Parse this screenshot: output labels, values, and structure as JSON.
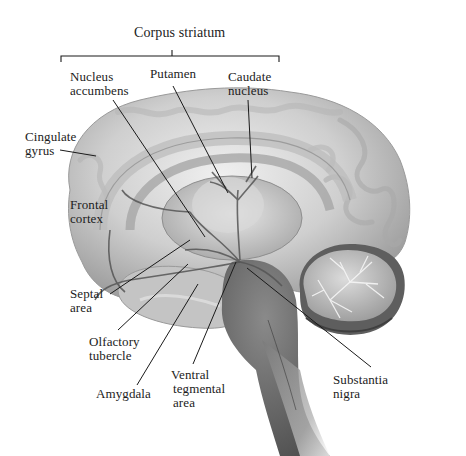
{
  "diagram": {
    "title": "Corpus striatum",
    "colors": {
      "background": "#ffffff",
      "cortex_light": "#e6e6e6",
      "cortex_mid": "#bdbdbd",
      "cortex_dark": "#8a8a8a",
      "brainstem": "#6e6e6e",
      "pathways": "#5a5a5a",
      "leader_lines": "#1a1a1a",
      "text": "#1c1c1c"
    },
    "bracket": {
      "label": "Corpus striatum",
      "groups": [
        "Nucleus accumbens",
        "Putamen",
        "Caudate nucleus"
      ]
    },
    "labels": {
      "corpus_striatum": "Corpus striatum",
      "nucleus_accumbens": {
        "line1": "Nucleus",
        "line2": "accumbens"
      },
      "putamen": "Putamen",
      "caudate_nucleus": {
        "line1": "Caudate",
        "line2": "nucleus"
      },
      "cingulate_gyrus": {
        "line1": "Cingulate",
        "line2": "gyrus"
      },
      "frontal_cortex": {
        "line1": "Frontal",
        "line2": "cortex"
      },
      "septal_area": {
        "line1": "Septal",
        "line2": "area"
      },
      "olfactory_tubercle": {
        "line1": "Olfactory",
        "line2": "tubercle"
      },
      "amygdala": "Amygdala",
      "ventral_tegmental_area": {
        "line1": "Ventral",
        "line2": "tegmental",
        "line3": "area"
      },
      "substantia_nigra": {
        "line1": "Substantia",
        "line2": "nigra"
      }
    }
  }
}
